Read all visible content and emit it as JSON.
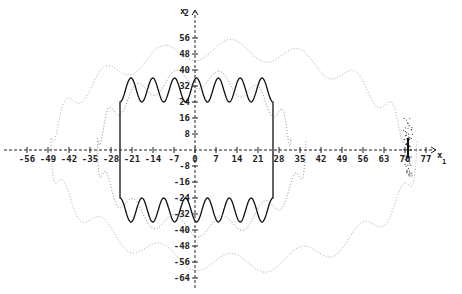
{
  "chart_data": {
    "type": "line",
    "title": "",
    "xlabel": "x1",
    "ylabel": "x2",
    "x_axis_label_main": "x",
    "x_axis_label_sub": "1",
    "y_axis_label_main": "x",
    "y_axis_label_sub": "2",
    "xlim": [
      -58,
      80
    ],
    "ylim": [
      -68,
      62
    ],
    "grid": false,
    "legend": null,
    "x_ticks": [
      -56,
      -49,
      -42,
      -35,
      -28,
      -21,
      -14,
      -7,
      0,
      7,
      14,
      21,
      28,
      35,
      42,
      49,
      56,
      63,
      70,
      77
    ],
    "y_ticks": [
      56,
      48,
      40,
      32,
      24,
      16,
      8,
      -8,
      -16,
      -24,
      -32,
      -40,
      -48,
      -56,
      -64
    ],
    "series": [
      {
        "name": "closed orbit (solid)",
        "style": "solid",
        "color": "#111111",
        "description": "Closed loop: vertical sides near x1=-25 and x1=26, top edge oscillating between x2≈24 and x2≈38, bottom edge oscillating between x2≈-24 and x2≈-38",
        "x_left": -25,
        "x_right": 26,
        "y_center": 30,
        "y_amp": 6,
        "oscillations": 7
      },
      {
        "name": "trajectory (dotted, inner)",
        "style": "dotted",
        "color": "#777777",
        "description": "Dotted spiral close to the orbit, x1 from about -28 to 36, oscillating top around x2≈28..44"
      },
      {
        "name": "trajectory (dotted, outer)",
        "style": "dotted",
        "color": "#999999",
        "description": "Outer dotted spiral sweeping from x1≈-49 to x1≈72, x2 up to ≈50 and down to ≈-64, converging to a dense cluster near x1≈71, x2≈0 (range ≈ -13..16)"
      }
    ],
    "annotations": [
      {
        "text": "dense point cluster",
        "x": 71,
        "y": 0
      }
    ]
  },
  "layout": {
    "origin_px": [
      195,
      150
    ],
    "px_per_unit_x": 3,
    "px_per_unit_y": 2
  }
}
